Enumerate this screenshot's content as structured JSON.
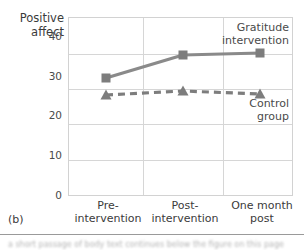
{
  "panel": {
    "letter": "(b)"
  },
  "footer": {
    "blurred_text": "a short passage of body text continues below the figure on this page"
  },
  "chart_data": {
    "type": "line",
    "title": "",
    "xlabel": "",
    "ylabel": "Positive\naffect",
    "categories": [
      "Pre-\nintervention",
      "Post-\nintervention",
      "One month\npost"
    ],
    "x": [
      0,
      1,
      2
    ],
    "ylim": [
      0,
      45
    ],
    "yticks": [
      0,
      10,
      20,
      30,
      40
    ],
    "ytick_labels": [
      "0",
      "10",
      "20",
      "30",
      "40"
    ],
    "grid": "both",
    "legend_position": "inline-annotations",
    "series": [
      {
        "name": "Gratitude\nintervention",
        "values": [
          33.2,
          39.7,
          40.2
        ],
        "color": "#8a8a8a",
        "marker": "square",
        "linestyle": "solid"
      },
      {
        "name": "Control\ngroup",
        "values": [
          28.4,
          29.6,
          28.6
        ],
        "color": "#8a8a8a",
        "marker": "triangle",
        "linestyle": "dashed"
      }
    ]
  }
}
